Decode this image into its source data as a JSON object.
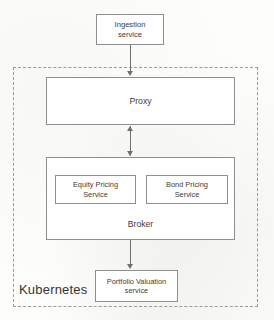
{
  "diagram": {
    "boundary": {
      "label": "Kubernetes",
      "style": "dashed"
    },
    "nodes": {
      "ingestion": {
        "label": "Ingestion\nservice"
      },
      "proxy": {
        "label": "Proxy"
      },
      "broker": {
        "label": "Broker"
      },
      "equity_pricing": {
        "label": "Equity Pricing\nService"
      },
      "bond_pricing": {
        "label": "Bond Pricing\nService"
      },
      "portfolio_valuation": {
        "label": "Portfolio Valuation\nservice"
      }
    },
    "edges": [
      {
        "from": "ingestion",
        "to": "proxy",
        "direction": "down"
      },
      {
        "from": "proxy",
        "to": "broker",
        "direction": "bidirectional"
      },
      {
        "from": "broker",
        "to": "portfolio_valuation",
        "direction": "down"
      }
    ],
    "colors": {
      "background": "#fdfdfc",
      "box_border": "#8e8e8e",
      "box_fill": "#ffffff",
      "text": "#3b3b3b",
      "boundary_border": "#9a9a9a",
      "connector": "#6f6f6f"
    }
  }
}
